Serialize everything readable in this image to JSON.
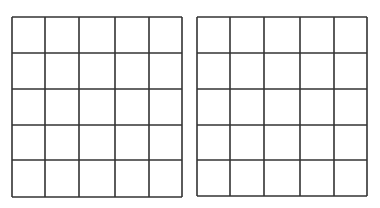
{
  "diagram": {
    "line_color": "#333333",
    "background": "#ffffff",
    "grids": [
      {
        "name": "left-grid",
        "rows": 5,
        "cols": 5,
        "x": 11,
        "y": 16,
        "col_lines": [
          0,
          33,
          67,
          103,
          137,
          170
        ],
        "row_lines": [
          0,
          36,
          72,
          108,
          143,
          180
        ]
      },
      {
        "name": "right-grid",
        "rows": 5,
        "cols": 5,
        "x": 196,
        "y": 16,
        "col_lines": [
          0,
          33,
          67,
          103,
          137,
          170
        ],
        "row_lines": [
          0,
          36,
          72,
          108,
          143,
          179
        ]
      }
    ]
  }
}
